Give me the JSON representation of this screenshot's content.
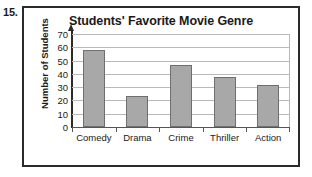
{
  "worksheet": {
    "question_number": "15."
  },
  "chart_data": {
    "type": "bar",
    "title": "Students' Favorite Movie Genre",
    "xlabel": "",
    "ylabel": "Number of Students",
    "categories": [
      "Comedy",
      "Drama",
      "Crime",
      "Thriller",
      "Action"
    ],
    "values": [
      58,
      23,
      47,
      38,
      32
    ],
    "ylim": [
      0,
      70
    ],
    "ytick_labels": [
      "70",
      "60",
      "50",
      "40",
      "30",
      "20",
      "10",
      "0"
    ],
    "ytick_values": [
      70,
      60,
      50,
      40,
      30,
      20,
      10,
      0
    ],
    "ytick_step": 10,
    "grid": true,
    "legend": false,
    "colors": {
      "bar_fill": "#a8a8a8",
      "bar_border": "#6f6f6f",
      "gridline": "#b9b9b9",
      "axis": "#2b2b2b",
      "frame": "#2b2b2b",
      "text": "#1a1a1a",
      "background": "#ffffff"
    }
  }
}
